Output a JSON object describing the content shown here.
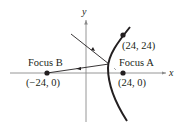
{
  "diagram": {
    "type": "hyperbola-branch-reflection",
    "axes": {
      "x_label": "x",
      "y_label": "y"
    },
    "foci": [
      {
        "name": "Focus A",
        "coords": "(24, 0)"
      },
      {
        "name": "Focus B",
        "coords": "(−24, 0)"
      }
    ],
    "point_on_curve": {
      "coords": "(24, 24)"
    },
    "colors": {
      "ink": "#231f20",
      "axis": "#8a8a8a",
      "background": "#ffffff"
    }
  }
}
